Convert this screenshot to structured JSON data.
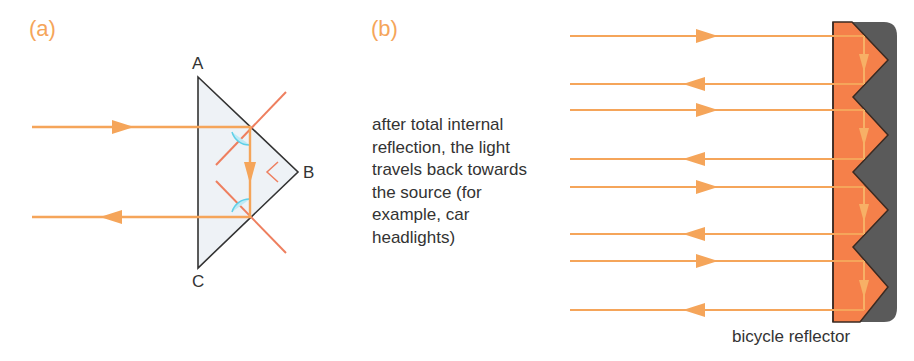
{
  "panels": {
    "a": {
      "label": "(a)",
      "vertices": {
        "A": "A",
        "B": "B",
        "C": "C"
      },
      "colors": {
        "ray": "#f5a55a",
        "normal": "#ee7f5f",
        "prism_fill": "#eef2f6",
        "prism_edge": "#333333",
        "angle_arc": "#5fd0e8"
      }
    },
    "b": {
      "label": "(b)",
      "caption": "after total internal\nreflection, the light\ntravels back towards\nthe source (for\nexample, car\nheadlights)",
      "reflector_label": "bicycle reflector",
      "colors": {
        "ray": "#f5a55a",
        "reflector_prism": "#f5804a",
        "reflector_back": "#5a5a5a"
      }
    }
  }
}
